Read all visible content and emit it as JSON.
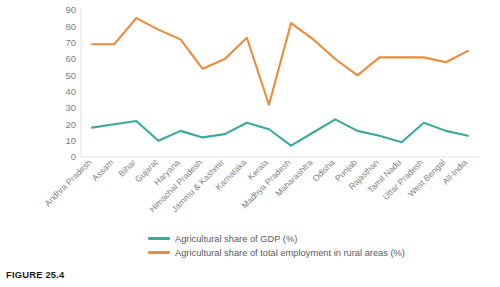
{
  "figure": {
    "caption": "FIGURE 25.4"
  },
  "legend": {
    "position": "bottom",
    "items": [
      {
        "label": "Agricultural share of GDP (%)",
        "color": "#3BA99C",
        "name": "gdp-share"
      },
      {
        "label": "Agricultural share of total employment in rural areas (%)",
        "color": "#ED8B3A",
        "name": "employment-share"
      }
    ]
  },
  "chart_data": {
    "type": "line",
    "title": "",
    "subtitle": "",
    "xlabel": "",
    "ylabel": "",
    "ylim": [
      0,
      90
    ],
    "yticks": [
      0,
      10,
      20,
      30,
      40,
      50,
      60,
      70,
      80,
      90
    ],
    "ytick_labels": [
      "0",
      "10",
      "20",
      "30",
      "40",
      "50",
      "60",
      "70",
      "80",
      "90"
    ],
    "grid": false,
    "legend_position": "bottom",
    "categories": [
      "Andhra Pradesh",
      "Assam",
      "Bihar",
      "Gujarat",
      "Haryana",
      "Himachal Pradesh",
      "Jammu & Kashmir",
      "Karnataka",
      "Kerala",
      "Madhya Pradesh",
      "Maharashtra",
      "Odisha",
      "Punjab",
      "Rajasthan",
      "Tamil Nadu",
      "Uttar Pradesh",
      "West Bengal",
      "All-India"
    ],
    "series": [
      {
        "name": "Agricultural share of GDP (%)",
        "color": "#3BA99C",
        "values": [
          18,
          20,
          22,
          10,
          16,
          12,
          14,
          21,
          17,
          7,
          15,
          23,
          16,
          13,
          9,
          21,
          16,
          13
        ]
      },
      {
        "name": "Agricultural share of total employment in rural areas (%)",
        "color": "#ED8B3A",
        "values": [
          69,
          69,
          85,
          78,
          72,
          54,
          60,
          73,
          32,
          82,
          72,
          60,
          50,
          61,
          61,
          61,
          58,
          65
        ]
      }
    ]
  }
}
